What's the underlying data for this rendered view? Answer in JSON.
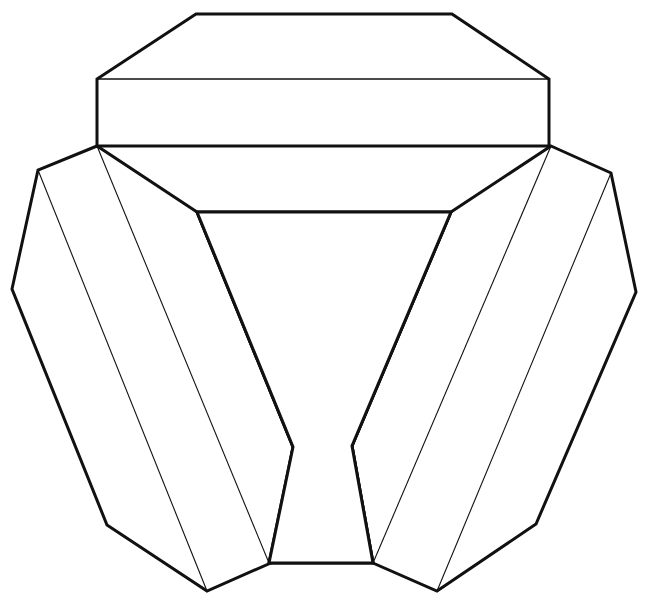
{
  "document": {
    "title": "Papercraft Net Diagram",
    "background_color": "#ffffff",
    "line_color": "#111111",
    "width": 647,
    "height": 613
  },
  "diagram": {
    "name": "unfolded-net-outline",
    "stroke_styles": {
      "cut_edge": "solid-thick",
      "fold_line": "solid-thin",
      "hidden_edge": "dashed-thin"
    },
    "parts": [
      {
        "id": "top-band-panel",
        "label": "top-band-panel",
        "points": "196,14 452,14 549,79 549,146 97,146 97,79"
      },
      {
        "id": "top-band-fold-upper",
        "label": "top-band-fold-upper",
        "points": "97,79 549,79"
      },
      {
        "id": "top-band-fold-lower",
        "label": "top-band-fold-lower",
        "points": "97,146 549,146"
      },
      {
        "id": "left-wing-panel",
        "label": "left-wing-panel",
        "points": "97,146 38,170 12,289 107,525 207,591 273,562 293,447 197,212"
      },
      {
        "id": "right-wing-panel",
        "label": "right-wing-panel",
        "points": "551,146 611,173 636,292 536,524 437,591 373,563 352,446 451,212"
      },
      {
        "id": "center-notch",
        "label": "center-notch",
        "points": "197,212 451,212 352,446 373,563 269,563 293,447"
      },
      {
        "id": "left-hidden-fold",
        "label": "left-hidden-fold",
        "points": "97,146 194,210"
      },
      {
        "id": "right-hidden-fold",
        "label": "right-hidden-fold",
        "points": "551,146 454,210"
      },
      {
        "id": "left-wing-crease-outer",
        "label": "left-wing-crease-outer",
        "points": "38,170 207,591"
      },
      {
        "id": "left-wing-crease-inner",
        "label": "left-wing-crease-inner",
        "points": "97,146 269,563"
      },
      {
        "id": "right-wing-crease-inner",
        "label": "right-wing-crease-inner",
        "points": "551,146 373,563"
      },
      {
        "id": "right-wing-crease-outer",
        "label": "right-wing-crease-outer",
        "points": "611,173 437,591"
      }
    ]
  }
}
